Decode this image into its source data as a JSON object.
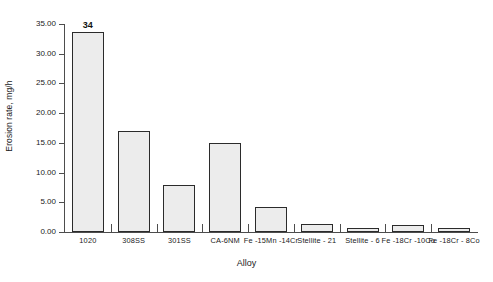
{
  "chart_data": {
    "type": "bar",
    "title": "",
    "xlabel": "Alloy",
    "ylabel": "Erosion rate, mg/h",
    "categories": [
      "1020",
      "308SS",
      "301SS",
      "CA-6NM",
      "Fe -15Mn -14Cr",
      "Stellite - 21",
      "Stellite - 6",
      "Fe -18Cr -10Co",
      "Fe -18Cr - 8Co"
    ],
    "values": [
      33.6,
      17.0,
      7.9,
      14.9,
      4.2,
      1.3,
      0.6,
      1.1,
      0.6
    ],
    "data_labels": [
      "34",
      "",
      "",
      "",
      "",
      "",
      "",
      "",
      ""
    ],
    "ylim": [
      0,
      35
    ],
    "ytick_values": [
      0,
      5,
      10,
      15,
      20,
      25,
      30,
      35
    ],
    "ytick_labels": [
      "0.00",
      "5.00",
      "10.00",
      "15.00",
      "20.00",
      "25.00",
      "30.00",
      "35.00"
    ],
    "grid": false,
    "legend": null,
    "bar_fill_color": "#ececec",
    "bar_border_color": "#2b2b2b",
    "axis_color": "#4d4d4d",
    "background_color": "#ffffff"
  }
}
